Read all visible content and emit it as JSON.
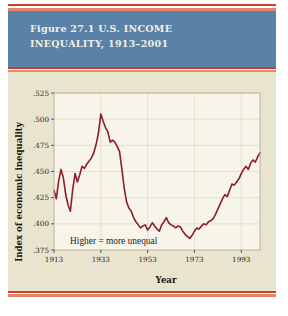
{
  "figure": {
    "title": "Figure 27.1 U.S. INCOME\nINEQUALITY, 1913–2001",
    "banner_color": "#5a81a8",
    "stripe_color": "#c4422e",
    "stripe_accent_color": "#e8836b",
    "body_color": "#e9e4cd"
  },
  "chart_data": {
    "type": "line",
    "title": "Figure 27.1 U.S. INCOME INEQUALITY, 1913–2001",
    "xlabel": "Year",
    "ylabel": "Index of economic inequality",
    "annotation": "Higher = more unequal",
    "line_color": "#8e1c2f",
    "plot_background": "#f7f5ea",
    "grid": true,
    "legend": "none",
    "xlim": [
      1913,
      2001
    ],
    "ylim": [
      0.375,
      0.525
    ],
    "xticks": [
      1913,
      1933,
      1953,
      1973,
      1993
    ],
    "xtick_labels": [
      "1913",
      "1933",
      "1953",
      "1973",
      "1993"
    ],
    "yticks": [
      0.375,
      0.4,
      0.425,
      0.45,
      0.475,
      0.5,
      0.525
    ],
    "ytick_labels": [
      ".375",
      ".400",
      ".425",
      ".450",
      ".475",
      ".500",
      ".525"
    ],
    "x": [
      1913,
      1914,
      1915,
      1916,
      1917,
      1918,
      1919,
      1920,
      1921,
      1922,
      1923,
      1924,
      1925,
      1926,
      1927,
      1928,
      1929,
      1930,
      1931,
      1932,
      1933,
      1934,
      1935,
      1936,
      1937,
      1938,
      1939,
      1940,
      1941,
      1942,
      1943,
      1944,
      1945,
      1946,
      1947,
      1948,
      1949,
      1950,
      1951,
      1952,
      1953,
      1954,
      1955,
      1956,
      1957,
      1958,
      1959,
      1960,
      1961,
      1962,
      1963,
      1964,
      1965,
      1966,
      1967,
      1968,
      1969,
      1970,
      1971,
      1972,
      1973,
      1974,
      1975,
      1976,
      1977,
      1978,
      1979,
      1980,
      1981,
      1982,
      1983,
      1984,
      1985,
      1986,
      1987,
      1988,
      1989,
      1990,
      1991,
      1992,
      1993,
      1994,
      1995,
      1996,
      1997,
      1998,
      1999,
      2000,
      2001
    ],
    "y": [
      0.432,
      0.424,
      0.441,
      0.452,
      0.444,
      0.428,
      0.418,
      0.412,
      0.433,
      0.448,
      0.44,
      0.447,
      0.455,
      0.453,
      0.457,
      0.46,
      0.463,
      0.468,
      0.476,
      0.487,
      0.505,
      0.498,
      0.492,
      0.488,
      0.478,
      0.48,
      0.478,
      0.474,
      0.469,
      0.452,
      0.434,
      0.421,
      0.415,
      0.412,
      0.406,
      0.402,
      0.399,
      0.396,
      0.398,
      0.399,
      0.394,
      0.397,
      0.401,
      0.398,
      0.395,
      0.393,
      0.399,
      0.402,
      0.406,
      0.401,
      0.399,
      0.398,
      0.396,
      0.398,
      0.397,
      0.393,
      0.39,
      0.388,
      0.386,
      0.389,
      0.393,
      0.396,
      0.395,
      0.398,
      0.4,
      0.399,
      0.402,
      0.403,
      0.405,
      0.409,
      0.414,
      0.419,
      0.424,
      0.428,
      0.426,
      0.432,
      0.438,
      0.437,
      0.44,
      0.443,
      0.448,
      0.452,
      0.455,
      0.452,
      0.458,
      0.461,
      0.459,
      0.464,
      0.468
    ]
  },
  "plot": {
    "x_axis_label": "Year",
    "y_axis_label": "Index of economic inequality",
    "annotation": "Higher = more unequal"
  }
}
